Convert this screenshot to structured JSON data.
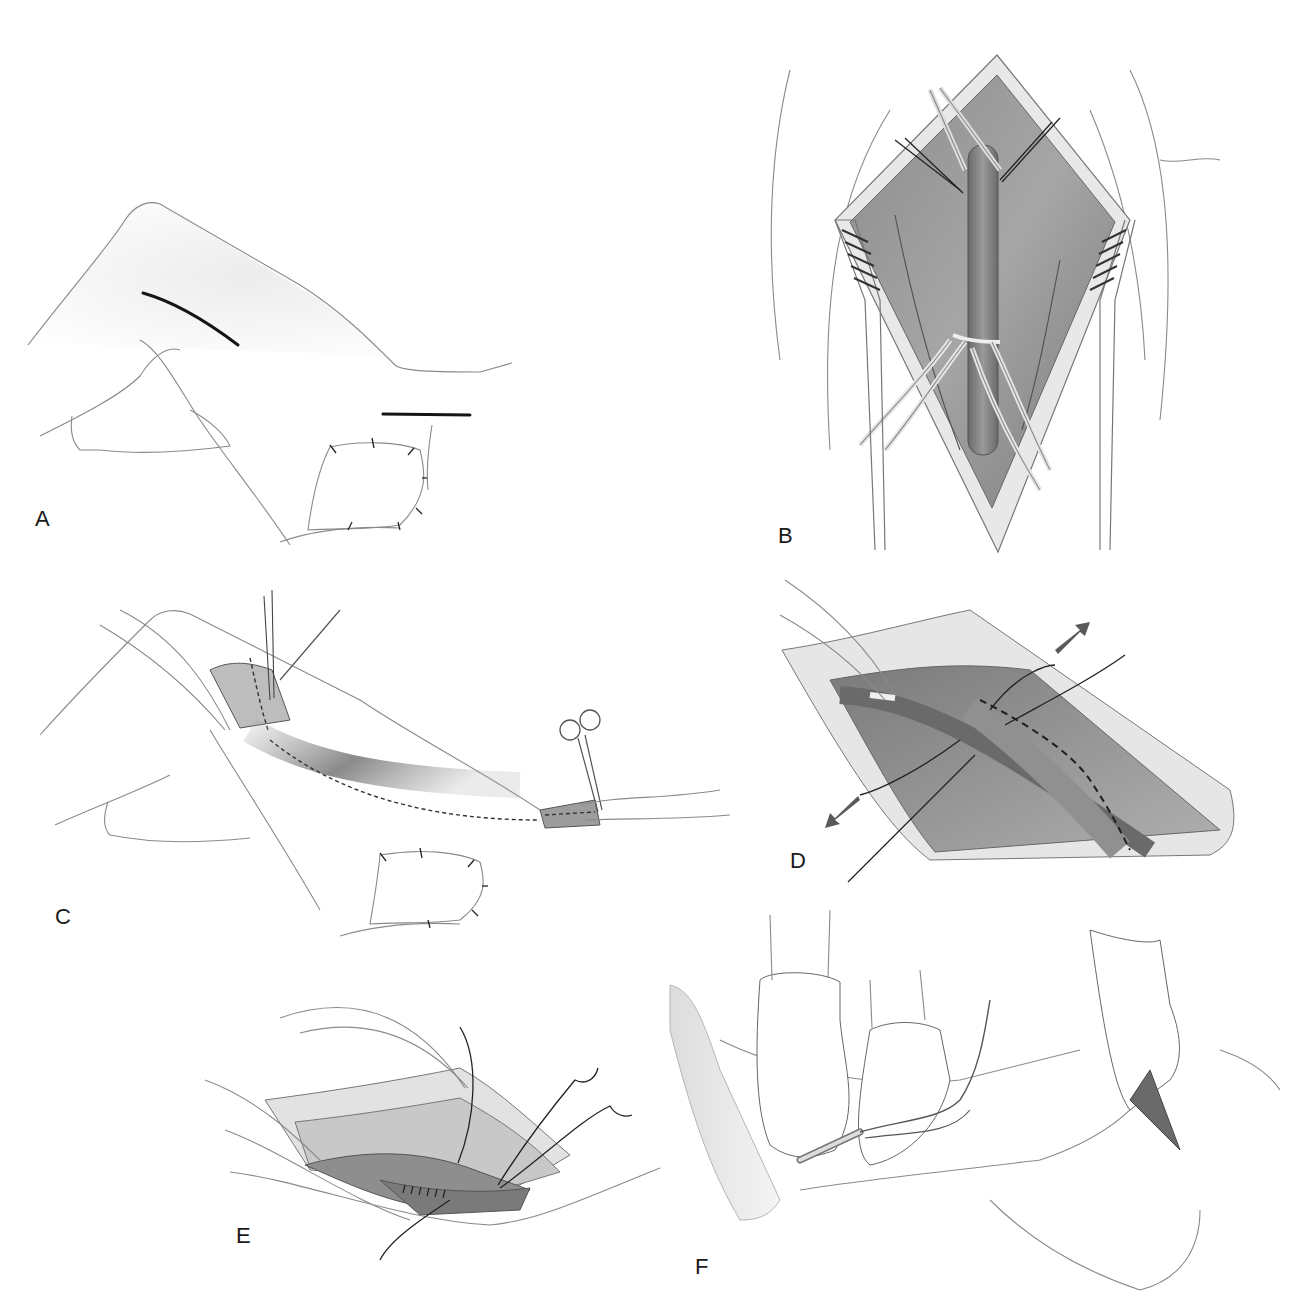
{
  "figure": {
    "panels": [
      {
        "id": "A",
        "label": "A",
        "description": "Leg with two marked skin incisions (thigh and below knee), dressing at knee"
      },
      {
        "id": "B",
        "label": "B",
        "description": "Retracted groin incision exposing vessel with vessel loops"
      },
      {
        "id": "C",
        "label": "C",
        "description": "Tunnel between proximal and distal incisions with graft passage, hemostat clamp"
      },
      {
        "id": "D",
        "label": "D",
        "description": "Anastomosis with dashed suture line and traction arrows"
      },
      {
        "id": "E",
        "label": "E",
        "description": "Completed suture line with needles"
      },
      {
        "id": "F",
        "label": "F",
        "description": "Gloved hands placing catheter, retractor on thigh"
      }
    ]
  },
  "colors": {
    "background": "#ffffff",
    "outline": "#8a8a8a",
    "incision": "#151515",
    "tissue_dark": "#6e6e6e",
    "tissue_mid": "#a3a3a3",
    "tissue_light": "#d6d6d6",
    "arrow": "#5a5a5a"
  }
}
